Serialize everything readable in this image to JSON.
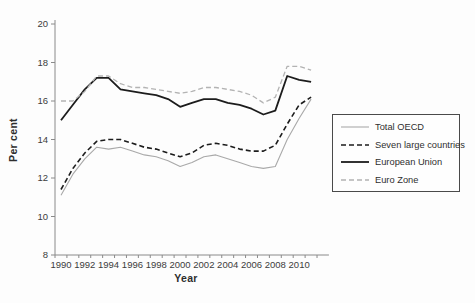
{
  "chart_data": {
    "type": "line",
    "title": "",
    "xlabel": "Year",
    "ylabel": "Per cent",
    "ylim": [
      8,
      20
    ],
    "ytick_step": 2,
    "xtick_label_step": 2,
    "grid": false,
    "legend_position": "right",
    "x": [
      1990,
      1991,
      1992,
      1993,
      1994,
      1995,
      1996,
      1997,
      1998,
      1999,
      2000,
      2001,
      2002,
      2003,
      2004,
      2005,
      2006,
      2007,
      2008,
      2009,
      2010,
      2011
    ],
    "series": [
      {
        "name": "Total OECD",
        "color": "#a9a9a9",
        "dash": "",
        "width": 1.1,
        "values": [
          11.1,
          12.2,
          13.0,
          13.6,
          13.5,
          13.6,
          13.4,
          13.2,
          13.1,
          12.9,
          12.6,
          12.8,
          13.1,
          13.2,
          13.0,
          12.8,
          12.6,
          12.5,
          12.6,
          14.0,
          15.1,
          16.1
        ]
      },
      {
        "name": "Seven large countries",
        "color": "#1c1c1c",
        "dash": "5,3",
        "width": 1.6,
        "values": [
          11.4,
          12.5,
          13.3,
          13.9,
          14.0,
          14.0,
          13.8,
          13.6,
          13.5,
          13.3,
          13.1,
          13.3,
          13.7,
          13.8,
          13.7,
          13.5,
          13.4,
          13.4,
          13.7,
          14.8,
          15.8,
          16.2
        ]
      },
      {
        "name": "European Union",
        "color": "#1c1c1c",
        "dash": "",
        "width": 1.8,
        "values": [
          15.0,
          15.8,
          16.6,
          17.2,
          17.2,
          16.6,
          16.5,
          16.4,
          16.3,
          16.1,
          15.7,
          15.9,
          16.1,
          16.1,
          15.9,
          15.8,
          15.6,
          15.3,
          15.5,
          17.3,
          17.1,
          17.0
        ]
      },
      {
        "name": "Euro Zone",
        "color": "#b3b3b3",
        "dash": "5,3",
        "width": 1.3,
        "values": [
          16.0,
          16.0,
          16.5,
          17.3,
          17.3,
          16.9,
          16.7,
          16.7,
          16.6,
          16.5,
          16.4,
          16.5,
          16.7,
          16.7,
          16.6,
          16.5,
          16.3,
          15.9,
          16.2,
          17.8,
          17.8,
          17.6
        ]
      }
    ],
    "axis_color": "#8a8a8a",
    "tick_label_color": "#3c3c3c"
  }
}
